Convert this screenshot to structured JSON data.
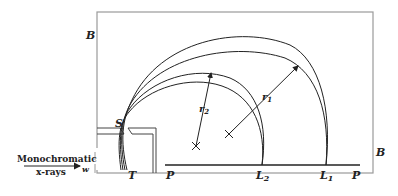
{
  "diagram": {
    "type": "mass-spectrometer-style magnetic deflection of photoelectrons",
    "labels": {
      "field_left": "B",
      "field_right": "B",
      "slit": "S",
      "target": "T",
      "plate_left": "P",
      "plate_right": "P",
      "line_2": "L",
      "line_2_sub": "2",
      "line_1": "L",
      "line_1_sub": "1",
      "radius_2": "r",
      "radius_2_sub": "2",
      "radius_1": "r",
      "radius_1_sub": "1",
      "beam_line1": "Monochromatic",
      "beam_line2": "x-rays",
      "beam_symbol": "w"
    },
    "colors": {
      "stroke": "#222222",
      "frame": "#9a9a9a",
      "background": "#ffffff"
    }
  }
}
